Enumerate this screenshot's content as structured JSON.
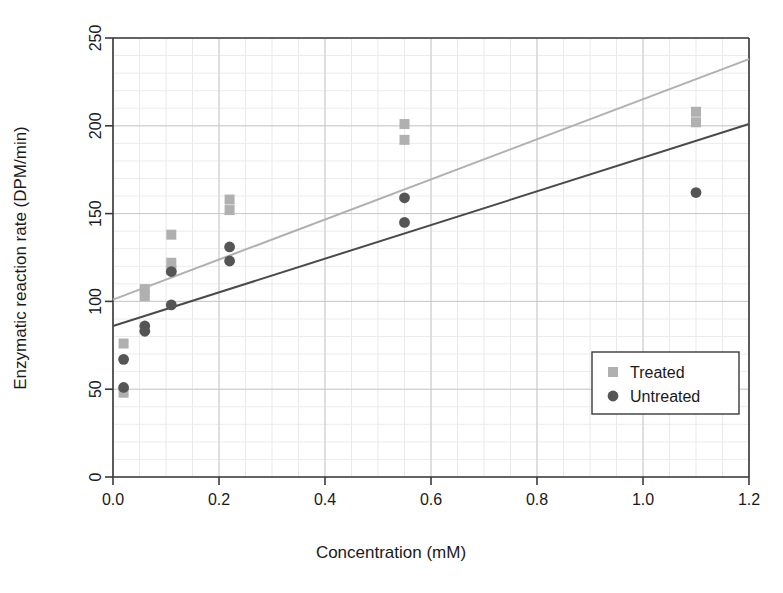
{
  "chart_data": {
    "type": "scatter",
    "title": "",
    "xlabel": "Concentration (mM)",
    "ylabel": "Enzymatic reaction rate (DPM/min)",
    "xlim": [
      0.0,
      1.2
    ],
    "ylim": [
      0,
      250
    ],
    "x_ticks": [
      "0.0",
      "0.2",
      "0.4",
      "0.6",
      "0.8",
      "1.0",
      "1.2"
    ],
    "x_tick_values": [
      0.0,
      0.2,
      0.4,
      0.6,
      0.8,
      1.0,
      1.2
    ],
    "y_ticks": [
      "0",
      "50",
      "100",
      "150",
      "200",
      "250"
    ],
    "y_tick_values": [
      0,
      50,
      100,
      150,
      200,
      250
    ],
    "x_minor_step": 0.05,
    "y_minor_step": 10,
    "grid": true,
    "legend_position": "lower right",
    "series": [
      {
        "name": "Treated",
        "marker": "square",
        "color": "#b0b0b0",
        "points": [
          [
            0.02,
            76
          ],
          [
            0.02,
            48
          ],
          [
            0.06,
            107
          ],
          [
            0.06,
            103
          ],
          [
            0.11,
            138
          ],
          [
            0.11,
            122
          ],
          [
            0.11,
            118
          ],
          [
            0.22,
            158
          ],
          [
            0.22,
            152
          ],
          [
            0.55,
            201
          ],
          [
            0.55,
            192
          ],
          [
            1.1,
            208
          ],
          [
            1.1,
            202
          ]
        ]
      },
      {
        "name": "Untreated",
        "marker": "circle",
        "color": "#555555",
        "points": [
          [
            0.02,
            67
          ],
          [
            0.02,
            51
          ],
          [
            0.06,
            86
          ],
          [
            0.06,
            83
          ],
          [
            0.11,
            117
          ],
          [
            0.11,
            98
          ],
          [
            0.22,
            131
          ],
          [
            0.22,
            123
          ],
          [
            0.55,
            159
          ],
          [
            0.55,
            145
          ],
          [
            1.1,
            162
          ]
        ]
      }
    ],
    "trendlines": [
      {
        "name": "Treated fit",
        "color": "#b0b0b0",
        "x0": 0.0,
        "y0": 101,
        "x1": 1.2,
        "y1": 238
      },
      {
        "name": "Untreated fit",
        "color": "#4a4a4a",
        "x0": 0.0,
        "y0": 86,
        "x1": 1.2,
        "y1": 201
      }
    ],
    "legend": [
      {
        "label": "Treated",
        "marker": "square",
        "color": "#b0b0b0"
      },
      {
        "label": "Untreated",
        "marker": "circle",
        "color": "#555555"
      }
    ]
  }
}
